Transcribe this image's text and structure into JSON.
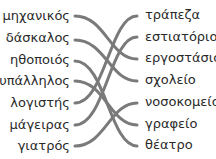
{
  "left_items": [
    "μηχανικός",
    "δάσκαλος",
    "ηθοποιός",
    "υπάλληλος",
    "λογιστής",
    "μάγειρας",
    "γιατρός"
  ],
  "right_items": [
    "τράπεζα",
    "εστιατόριο",
    "εργοστάσιο",
    "σχολείο",
    "νοσοκομείο",
    "γραφείο",
    "θέατρο"
  ],
  "matches": [
    {
      "left": "μηχανικός",
      "right": "εργοστάσιο"
    },
    {
      "left": "δάσκαλος",
      "right": "σχολείο"
    },
    {
      "left": "ηθοποιός",
      "right": "θέατρο"
    },
    {
      "left": "υπάλληλος",
      "right": "γραφείο"
    },
    {
      "left": "λογιστής",
      "right": "τράπεζα"
    },
    {
      "left": "μάγειρας",
      "right": "εστιατόριο"
    },
    {
      "left": "γιατρός",
      "right": "νοσοκομείο"
    }
  ],
  "line_color": "#7a7a7a"
}
